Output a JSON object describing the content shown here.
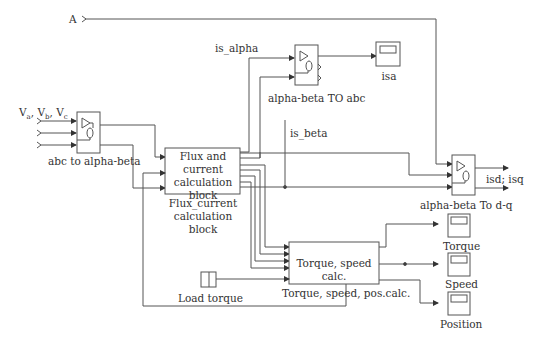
{
  "inputs": {
    "a_port": "A",
    "voltage_label": "V_a, V_b, V_c",
    "voltage_parts": [
      "V",
      "a",
      ", V",
      "b",
      ", V",
      "c"
    ]
  },
  "blocks": {
    "abc_to_alpha_beta": {
      "label": "abc to alpha-beta"
    },
    "flux": {
      "inner_text": [
        "Flux and current",
        "calculation",
        "block"
      ],
      "label": [
        "Flux_current",
        "calculation",
        "block"
      ]
    },
    "alpha_beta_to_abc": {
      "label": "alpha-beta TO abc"
    },
    "alpha_beta_to_dq": {
      "label": "alpha-beta To d-q"
    },
    "torque_speed": {
      "inner_text": "Torque, speed calc.",
      "label": "Torque, speed, pos.calc."
    },
    "load_torque": {
      "label": "Load torque"
    }
  },
  "signals": {
    "is_alpha": "is_alpha",
    "is_beta": "is_beta",
    "isd_isq": "isd; isq"
  },
  "scopes": [
    {
      "id": "isa",
      "label": "isa"
    },
    {
      "id": "torque",
      "label": "Torque"
    },
    {
      "id": "speed",
      "label": "Speed"
    },
    {
      "id": "position",
      "label": "Position"
    }
  ],
  "colors": {
    "line": "#444444",
    "text": "#333333",
    "background": "#ffffff"
  }
}
